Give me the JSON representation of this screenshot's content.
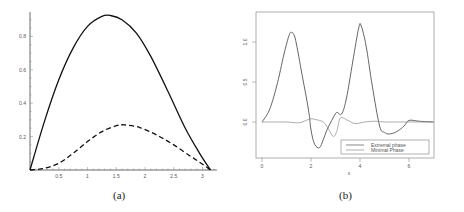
{
  "chart_data": [
    {
      "type": "line",
      "caption": "(a)",
      "title": "",
      "xlabel": "",
      "ylabel": "",
      "xlim": [
        0,
        3.2
      ],
      "ylim": [
        0,
        0.95
      ],
      "x_ticks": [
        "0.5",
        "1",
        "1.5",
        "2",
        "2.5",
        "3"
      ],
      "y_ticks": [
        "0.2",
        "0.4",
        "0.6",
        "0.8"
      ],
      "grid": false,
      "series": [
        {
          "name": "solid",
          "style": "solid",
          "x": [
            0,
            0.25,
            0.5,
            0.75,
            1.0,
            1.25,
            1.4,
            1.6,
            1.85,
            2.1,
            2.4,
            2.7,
            2.95,
            3.14
          ],
          "y": [
            0,
            0.29,
            0.54,
            0.73,
            0.86,
            0.92,
            0.925,
            0.9,
            0.82,
            0.68,
            0.47,
            0.25,
            0.1,
            0
          ]
        },
        {
          "name": "dashed",
          "style": "dashed",
          "x": [
            0,
            0.25,
            0.5,
            0.75,
            1.0,
            1.25,
            1.5,
            1.65,
            1.9,
            2.2,
            2.5,
            2.8,
            3.0,
            3.14
          ],
          "y": [
            0,
            0.01,
            0.04,
            0.1,
            0.17,
            0.23,
            0.265,
            0.27,
            0.255,
            0.21,
            0.15,
            0.08,
            0.035,
            0
          ]
        }
      ]
    },
    {
      "type": "line",
      "caption": "(b)",
      "title": "",
      "xlabel": "x",
      "ylabel": "",
      "xlim": [
        -0.2,
        7
      ],
      "ylim": [
        -0.45,
        1.35
      ],
      "x_ticks": [
        "0",
        "2",
        "4",
        "6"
      ],
      "y_ticks": [
        "0.0",
        "0.5",
        "1.0"
      ],
      "grid": false,
      "legend": {
        "position": "lower right",
        "entries": [
          "Extremal phase",
          "Minimal Phase"
        ]
      },
      "series": [
        {
          "name": "Extremal phase",
          "color": "#555555",
          "x": [
            0,
            0.3,
            0.6,
            0.9,
            1.1,
            1.2,
            1.35,
            1.6,
            1.9,
            2.0,
            2.15,
            2.35,
            2.5,
            2.65,
            2.9,
            3.05,
            3.25,
            3.45,
            3.7,
            3.95,
            4.05,
            4.25,
            4.5,
            4.8,
            5.0,
            5.2,
            5.5,
            5.8,
            6.0,
            6.4,
            7.0
          ],
          "y": [
            0,
            0.15,
            0.45,
            0.85,
            1.08,
            1.12,
            1.05,
            0.65,
            0.15,
            -0.1,
            -0.28,
            -0.32,
            -0.22,
            -0.1,
            0.05,
            0.12,
            0.1,
            0.3,
            0.75,
            1.18,
            1.2,
            0.95,
            0.45,
            -0.05,
            -0.13,
            -0.15,
            -0.12,
            -0.05,
            0.02,
            0.01,
            0
          ]
        },
        {
          "name": "Minimal Phase",
          "color": "#888888",
          "x": [
            0,
            0.5,
            1.0,
            1.5,
            1.8,
            2.0,
            2.2,
            2.5,
            2.7,
            2.9,
            3.05,
            3.2,
            3.5,
            3.8,
            4.2,
            4.6,
            5.0,
            5.5,
            6.0,
            7.0
          ],
          "y": [
            0,
            0,
            0,
            -0.01,
            0.02,
            0.04,
            0.03,
            0.0,
            -0.08,
            -0.18,
            -0.12,
            0.05,
            0.02,
            -0.02,
            0.0,
            0.01,
            0.0,
            0.0,
            0.0,
            0
          ]
        }
      ]
    }
  ]
}
